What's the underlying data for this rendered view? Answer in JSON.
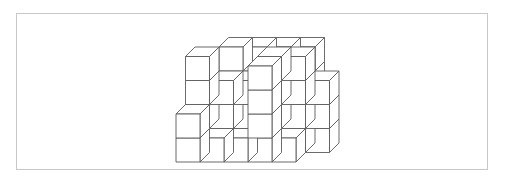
{
  "figure": {
    "colors": {
      "stroke": "#5a5a5a",
      "fill": "#ffffff",
      "frame": "#c8c8c8"
    },
    "projection": {
      "origin_x": 176,
      "origin_y": 162,
      "unit": 24,
      "depth_dx": 9.5,
      "depth_dy": -9.5
    },
    "grid_columns": 5,
    "grid_rows": 3,
    "heights": [
      [
        0,
        4,
        4,
        4,
        4
      ],
      [
        4,
        3,
        3,
        4,
        4
      ],
      [
        2,
        1,
        1,
        4,
        1
      ]
    ],
    "extra_right_stack": {
      "col": 5,
      "row": 1,
      "height": 3
    }
  }
}
